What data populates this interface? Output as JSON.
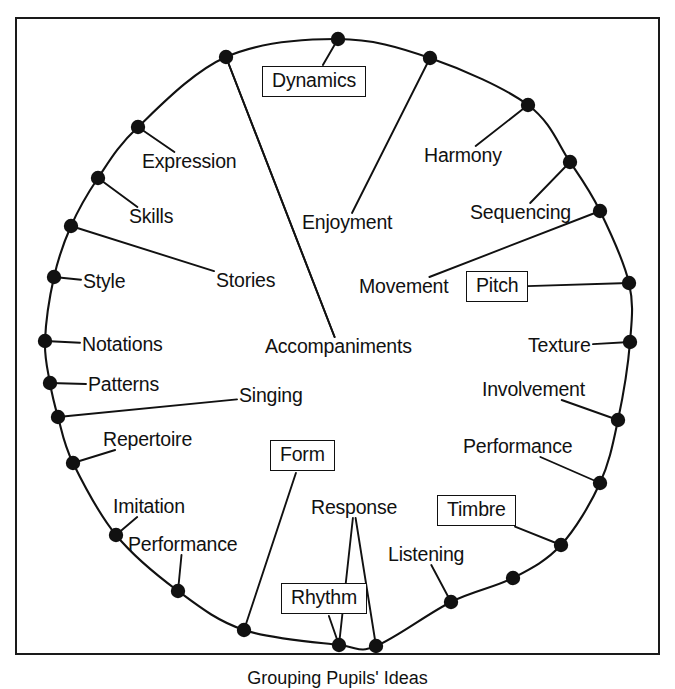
{
  "diagram": {
    "caption": "Grouping Pupils' Ideas",
    "frame": {
      "border_color": "#1a1a1a"
    },
    "node_color": "#111111",
    "line_color": "#111111",
    "boxed_labels": [
      "Dynamics",
      "Pitch",
      "Timbre",
      "Rhythm",
      "Form"
    ],
    "labels": [
      {
        "id": "dynamics",
        "text": "Dynamics",
        "boxed": true,
        "x": 262,
        "y": 66,
        "anchor_x": 338,
        "anchor_y": 39
      },
      {
        "id": "harmony",
        "text": "Harmony",
        "boxed": false,
        "x": 424,
        "y": 146,
        "anchor_x": 528,
        "anchor_y": 105
      },
      {
        "id": "sequencing",
        "text": "Sequencing",
        "boxed": false,
        "x": 470,
        "y": 203,
        "anchor_x": 570,
        "anchor_y": 162
      },
      {
        "id": "pitch",
        "text": "Pitch",
        "boxed": true,
        "x": 466,
        "y": 271,
        "anchor_x": 629,
        "anchor_y": 283
      },
      {
        "id": "texture",
        "text": "Texture",
        "boxed": false,
        "x": 528,
        "y": 336,
        "anchor_x": 630,
        "anchor_y": 342
      },
      {
        "id": "involvement",
        "text": "Involvement",
        "boxed": false,
        "x": 482,
        "y": 380,
        "anchor_x": 618,
        "anchor_y": 420
      },
      {
        "id": "performance-r",
        "text": "Performance",
        "boxed": false,
        "x": 463,
        "y": 437,
        "anchor_x": 600,
        "anchor_y": 483
      },
      {
        "id": "timbre",
        "text": "Timbre",
        "boxed": true,
        "x": 437,
        "y": 495,
        "anchor_x": 561,
        "anchor_y": 545
      },
      {
        "id": "listening",
        "text": "Listening",
        "boxed": false,
        "x": 388,
        "y": 545,
        "anchor_x": 451,
        "anchor_y": 602
      },
      {
        "id": "rhythm",
        "text": "Rhythm",
        "boxed": true,
        "x": 281,
        "y": 583,
        "anchor_x": 339,
        "anchor_y": 645
      },
      {
        "id": "response",
        "text": "Response",
        "boxed": false,
        "x": 311,
        "y": 498,
        "anchor_x": 339,
        "anchor_y": 645
      },
      {
        "id": "form",
        "text": "Form",
        "boxed": true,
        "x": 270,
        "y": 440,
        "anchor_x": 244,
        "anchor_y": 630
      },
      {
        "id": "performance-l",
        "text": "Performance",
        "boxed": false,
        "x": 128,
        "y": 535,
        "anchor_x": 178,
        "anchor_y": 591
      },
      {
        "id": "imitation",
        "text": "Imitation",
        "boxed": false,
        "x": 113,
        "y": 497,
        "anchor_x": 116,
        "anchor_y": 535
      },
      {
        "id": "repertoire",
        "text": "Repertoire",
        "boxed": false,
        "x": 103,
        "y": 430,
        "anchor_x": 73,
        "anchor_y": 463
      },
      {
        "id": "singing",
        "text": "Singing",
        "boxed": false,
        "x": 239,
        "y": 386,
        "anchor_x": 58,
        "anchor_y": 417
      },
      {
        "id": "patterns",
        "text": "Patterns",
        "boxed": false,
        "x": 88,
        "y": 375,
        "anchor_x": 50,
        "anchor_y": 383
      },
      {
        "id": "notations",
        "text": "Notations",
        "boxed": false,
        "x": 82,
        "y": 335,
        "anchor_x": 45,
        "anchor_y": 341
      },
      {
        "id": "style",
        "text": "Style",
        "boxed": false,
        "x": 83,
        "y": 272,
        "anchor_x": 54,
        "anchor_y": 277
      },
      {
        "id": "stories",
        "text": "Stories",
        "boxed": false,
        "x": 216,
        "y": 271,
        "anchor_x": 71,
        "anchor_y": 226
      },
      {
        "id": "skills",
        "text": "Skills",
        "boxed": false,
        "x": 129,
        "y": 207,
        "anchor_x": 98,
        "anchor_y": 178
      },
      {
        "id": "expression",
        "text": "Expression",
        "boxed": false,
        "x": 142,
        "y": 152,
        "anchor_x": 138,
        "anchor_y": 127
      },
      {
        "id": "enjoyment",
        "text": "Enjoyment",
        "boxed": false,
        "x": 302,
        "y": 213,
        "anchor_x": 430,
        "anchor_y": 58
      },
      {
        "id": "accompaniments",
        "text": "Accompaniments",
        "boxed": false,
        "x": 265,
        "y": 337,
        "anchor_x": 226,
        "anchor_y": 57
      },
      {
        "id": "movement",
        "text": "Movement",
        "boxed": false,
        "x": 359,
        "y": 277,
        "anchor_x": 600,
        "anchor_y": 211
      }
    ],
    "nodes": [
      {
        "id": "n-top",
        "x": 338,
        "y": 39
      },
      {
        "id": "n-1",
        "x": 430,
        "y": 58
      },
      {
        "id": "n-2",
        "x": 528,
        "y": 105
      },
      {
        "id": "n-3",
        "x": 570,
        "y": 162
      },
      {
        "id": "n-4",
        "x": 600,
        "y": 211
      },
      {
        "id": "n-5",
        "x": 629,
        "y": 283
      },
      {
        "id": "n-6",
        "x": 630,
        "y": 342
      },
      {
        "id": "n-7",
        "x": 618,
        "y": 420
      },
      {
        "id": "n-8",
        "x": 600,
        "y": 483
      },
      {
        "id": "n-9",
        "x": 561,
        "y": 545
      },
      {
        "id": "n-10",
        "x": 513,
        "y": 578
      },
      {
        "id": "n-11",
        "x": 451,
        "y": 602
      },
      {
        "id": "n-12",
        "x": 376,
        "y": 646
      },
      {
        "id": "n-13",
        "x": 339,
        "y": 645
      },
      {
        "id": "n-14",
        "x": 244,
        "y": 630
      },
      {
        "id": "n-15",
        "x": 178,
        "y": 591
      },
      {
        "id": "n-16",
        "x": 116,
        "y": 535
      },
      {
        "id": "n-17",
        "x": 73,
        "y": 463
      },
      {
        "id": "n-18",
        "x": 58,
        "y": 417
      },
      {
        "id": "n-19",
        "x": 50,
        "y": 383
      },
      {
        "id": "n-20",
        "x": 45,
        "y": 341
      },
      {
        "id": "n-21",
        "x": 54,
        "y": 277
      },
      {
        "id": "n-22",
        "x": 71,
        "y": 226
      },
      {
        "id": "n-23",
        "x": 98,
        "y": 178
      },
      {
        "id": "n-24",
        "x": 138,
        "y": 127
      },
      {
        "id": "n-25",
        "x": 226,
        "y": 57
      }
    ]
  }
}
